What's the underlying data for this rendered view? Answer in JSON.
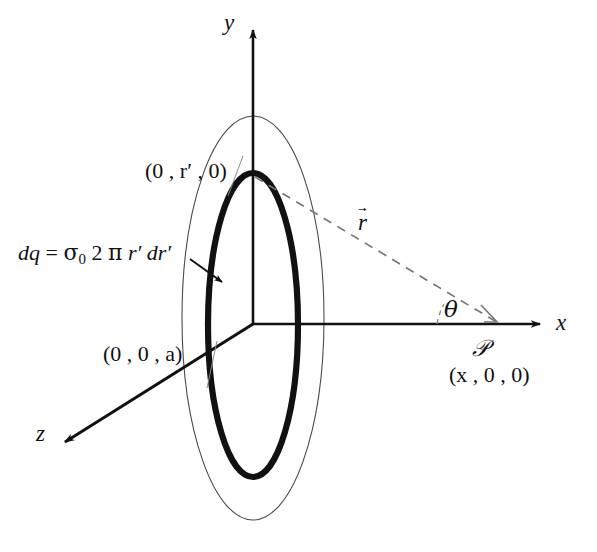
{
  "figure": {
    "background_color": "#ffffff",
    "line_color": "#111111",
    "thin_line_color": "#4a4a4a",
    "dashed_color": "#666666"
  },
  "axes": [
    {
      "name": "y-axis",
      "label": "y"
    },
    {
      "name": "x-axis",
      "label": "x"
    },
    {
      "name": "z-axis",
      "label": "z"
    }
  ],
  "labels": {
    "axis_y": "y",
    "axis_x": "x",
    "axis_z": "z",
    "ring_point": "(0 , r′ , 0)",
    "disk_edge_point": "(0 , 0 , a)",
    "field_point_name": "𝒫",
    "field_point_coords": "(x , 0 , 0)",
    "position_vector": "r",
    "angle": "θ",
    "charge_element_lhs": "dq",
    "charge_element_eq": "=",
    "charge_element_sigma": "σ",
    "charge_element_sigma_sub": "0",
    "charge_element_two": "2",
    "charge_element_pi": "π",
    "charge_element_rprime": "r′",
    "charge_element_drprime": "dr′",
    "charge_element_full": "dq = σ₀ 2 π r′ dr′"
  },
  "geometry": {
    "origin": {
      "x": 253,
      "y": 324
    },
    "y_axis_tip": {
      "x": 253,
      "y": 22
    },
    "x_axis_tip": {
      "x": 548,
      "y": 324
    },
    "z_axis_tip": {
      "x": 57,
      "y": 448
    },
    "outer_ellipse": {
      "cx": 253,
      "cy": 318,
      "rx": 71,
      "ry": 202,
      "stroke_width": 1.1
    },
    "ring_ellipse": {
      "cx": 253,
      "cy": 325,
      "rx": 45,
      "ry": 152,
      "stroke_width": 6
    },
    "ring_top_point": {
      "x": 253,
      "y": 176
    },
    "field_point": {
      "x": 497,
      "y": 322
    },
    "arrow_callout_start": {
      "x": 193,
      "y": 262
    },
    "arrow_callout_end": {
      "x": 227,
      "y": 285
    }
  }
}
